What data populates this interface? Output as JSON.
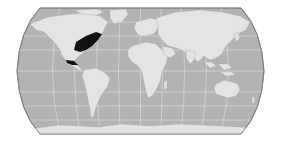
{
  "map": {
    "projection": "robinson-like pseudocylindrical world map",
    "colors": {
      "ocean": "#b3b3b3",
      "land": "#e4e4e4",
      "graticule": "#eeeeee",
      "border": "#7a7a7a",
      "highlight": "#111111",
      "background": "#ffffff"
    },
    "highlighted_regions": [
      {
        "name": "Eastern United States",
        "color": "#111111"
      },
      {
        "name": "Southern Mexico / Central America",
        "color": "#111111"
      }
    ],
    "bounds_px": {
      "left": 17,
      "right": 264,
      "top": 8,
      "bottom": 134
    }
  }
}
